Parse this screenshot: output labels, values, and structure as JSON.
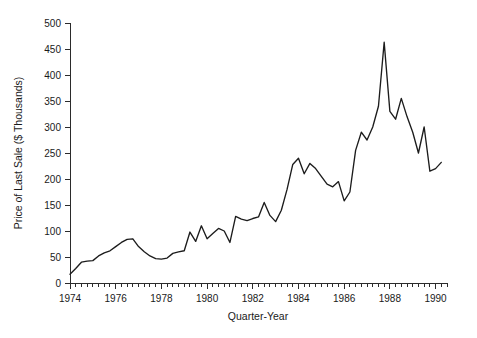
{
  "chart_data": {
    "type": "line",
    "title": "",
    "subtitle": "",
    "xlabel": "Quarter-Year",
    "ylabel": "Price of Last Sale ($ Thousands)",
    "xlim": [
      1974.0,
      1990.5
    ],
    "ylim": [
      0,
      500
    ],
    "grid": false,
    "legend": null,
    "x_tick_labels": [
      "1974",
      "1976",
      "1978",
      "1980",
      "1982",
      "1984",
      "1986",
      "1988",
      "1990"
    ],
    "x_tick_values": [
      1974,
      1976,
      1978,
      1980,
      1982,
      1984,
      1986,
      1988,
      1990
    ],
    "x_minor_tick_interval": 0.25,
    "y_tick_labels": [
      "0",
      "50",
      "100",
      "150",
      "200",
      "250",
      "300",
      "350",
      "400",
      "450",
      "500"
    ],
    "y_tick_values": [
      0,
      50,
      100,
      150,
      200,
      250,
      300,
      350,
      400,
      450,
      500
    ],
    "series": [
      {
        "name": "Price of Last Sale",
        "color": "#1c1c1c",
        "x": [
          1974.0,
          1974.25,
          1974.5,
          1974.75,
          1975.0,
          1975.25,
          1975.5,
          1975.75,
          1976.0,
          1976.25,
          1976.5,
          1976.75,
          1977.0,
          1977.25,
          1977.5,
          1977.75,
          1978.0,
          1978.25,
          1978.5,
          1978.75,
          1979.0,
          1979.25,
          1979.5,
          1979.75,
          1980.0,
          1980.25,
          1980.5,
          1980.75,
          1981.0,
          1981.25,
          1981.5,
          1981.75,
          1982.0,
          1982.25,
          1982.5,
          1982.75,
          1983.0,
          1983.25,
          1983.5,
          1983.75,
          1984.0,
          1984.25,
          1984.5,
          1984.75,
          1985.0,
          1985.25,
          1985.5,
          1985.75,
          1986.0,
          1986.25,
          1986.5,
          1986.75,
          1987.0,
          1987.25,
          1987.5,
          1987.75,
          1988.0,
          1988.25,
          1988.5,
          1988.75,
          1989.0,
          1989.25,
          1989.5,
          1989.75,
          1990.0,
          1990.25
        ],
        "values": [
          17,
          28,
          40,
          42,
          43,
          52,
          58,
          62,
          70,
          78,
          84,
          85,
          70,
          60,
          52,
          47,
          46,
          48,
          57,
          60,
          62,
          98,
          80,
          110,
          85,
          95,
          105,
          100,
          78,
          128,
          123,
          120,
          124,
          127,
          155,
          130,
          118,
          140,
          180,
          228,
          240,
          210,
          230,
          220,
          205,
          190,
          185,
          195,
          158,
          175,
          255,
          290,
          275,
          300,
          340,
          463,
          330,
          315,
          355,
          320,
          290,
          250,
          300,
          215,
          220,
          232
        ]
      }
    ]
  },
  "axis": {
    "y_title": "Price of Last Sale ($ Thousands)",
    "x_title": "Quarter-Year"
  }
}
